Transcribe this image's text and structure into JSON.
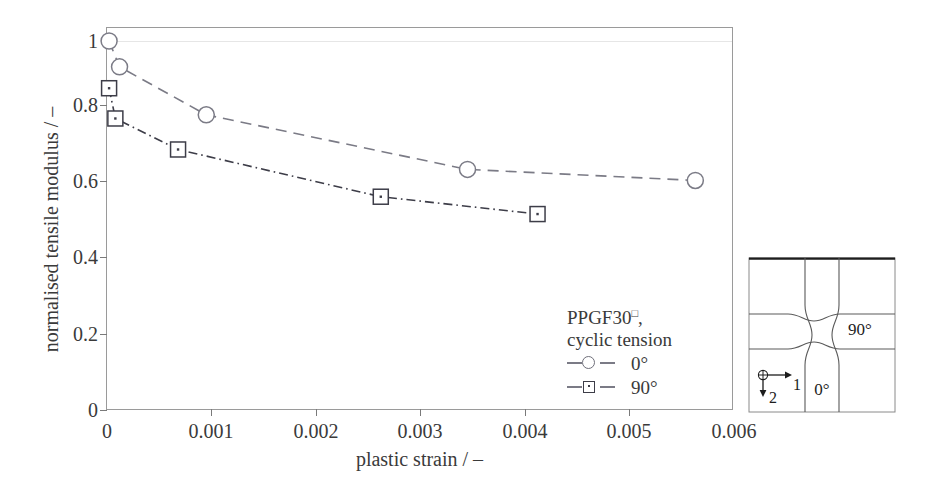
{
  "chart_data": {
    "type": "line",
    "title": "",
    "xlabel": "plastic strain / –",
    "ylabel": "normalised tensile modulus / –",
    "xlim": [
      0,
      0.006
    ],
    "ylim": [
      0,
      1.0
    ],
    "xticks": [
      0,
      0.001,
      0.002,
      0.003,
      0.004,
      0.005,
      0.006
    ],
    "xtick_labels": [
      "0",
      "0.001",
      "0.002",
      "0.003",
      "0.004",
      "0.005",
      "0.006"
    ],
    "yticks": [
      0,
      0.2,
      0.4,
      0.6,
      0.8,
      1.0
    ],
    "ytick_labels": [
      "0",
      "0.2",
      "0.4",
      "0.6",
      "0.8",
      "1"
    ],
    "grid": "horizontal-faint-at-1.0",
    "legend_position": "inside-lower-right",
    "series": [
      {
        "name": "0°",
        "marker": "open-circle",
        "linestyle": "dashed",
        "color": "#7b7b86",
        "x": [
          2e-05,
          0.00012,
          0.00095,
          0.00345,
          0.00563
        ],
        "y": [
          1.0,
          0.93,
          0.8,
          0.652,
          0.622
        ]
      },
      {
        "name": "90°",
        "marker": "open-square-dot",
        "linestyle": "dash-dot",
        "color": "#3d3d48",
        "x": [
          2e-05,
          8e-05,
          0.00068,
          0.00262,
          0.00412
        ],
        "y": [
          0.872,
          0.79,
          0.706,
          0.578,
          0.531
        ]
      }
    ]
  },
  "axes": {
    "x_title": "plastic strain / –",
    "y_title": "normalised tensile modulus / –",
    "x_tick_labels": [
      "0",
      "0.001",
      "0.002",
      "0.003",
      "0.004",
      "0.005",
      "0.006"
    ],
    "y_tick_labels": [
      "0",
      "0.2",
      "0.4",
      "0.6",
      "0.8",
      "1"
    ]
  },
  "legend": {
    "material": "PPGF30",
    "material_superscript": "□",
    "material_suffix": ",",
    "loading": "cyclic tension",
    "entries": [
      {
        "label": "0°",
        "marker": "open-circle",
        "color": "#7b7b86"
      },
      {
        "label": "90°",
        "marker": "open-square-dot",
        "color": "#3d3d48"
      }
    ]
  },
  "inset": {
    "label_vertical": "0°",
    "label_horizontal": "90°",
    "axis_1_label": "1",
    "axis_2_label": "2",
    "origin_symbol": "⊕"
  },
  "colors": {
    "series_0deg": "#7b7b86",
    "series_90deg": "#3d3d48",
    "frame": "#9a9a9a",
    "text": "#3a3a3a",
    "gridline": "#e6e6e6",
    "background": "#ffffff"
  }
}
